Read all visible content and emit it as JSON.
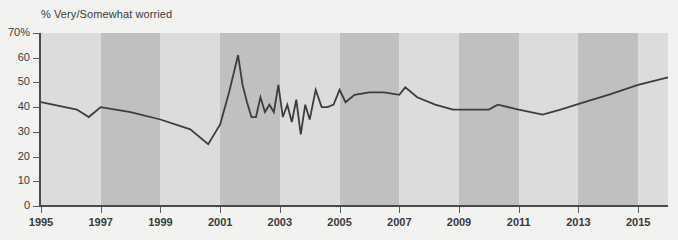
{
  "chart_data": {
    "type": "line",
    "title": "% Very/Somewhat worried",
    "xlabel": "",
    "ylabel": "",
    "ylim": [
      0,
      70
    ],
    "xlim": [
      1995,
      2016
    ],
    "grid": false,
    "legend": "none",
    "y_ticks": [
      "0",
      "10",
      "20",
      "30",
      "40",
      "50",
      "60",
      "70%"
    ],
    "y_tick_values": [
      0,
      10,
      20,
      30,
      40,
      50,
      60,
      70
    ],
    "x_ticks": [
      "1995",
      "1997",
      "1999",
      "2001",
      "2003",
      "2005",
      "2007",
      "2009",
      "2011",
      "2013",
      "2015"
    ],
    "x_tick_values": [
      1995,
      1997,
      1999,
      2001,
      2003,
      2005,
      2007,
      2009,
      2011,
      2013,
      2015
    ],
    "band_shading": "alternating two-year vertical bands, light and dark gray",
    "line_color": "#3d3d3d",
    "band_light_color": "#dcdcdc",
    "band_dark_color": "#c0c0c0",
    "background_color": "#f2f2f0",
    "series": [
      {
        "name": "% Very/Somewhat worried",
        "x": [
          1995.0,
          1996.2,
          1996.6,
          1997.0,
          1998.0,
          1999.0,
          2000.0,
          2000.6,
          2001.0,
          2001.3,
          2001.6,
          2001.75,
          2001.9,
          2002.05,
          2002.2,
          2002.35,
          2002.5,
          2002.65,
          2002.8,
          2002.95,
          2003.1,
          2003.25,
          2003.4,
          2003.55,
          2003.7,
          2003.85,
          2004.0,
          2004.2,
          2004.4,
          2004.6,
          2004.8,
          2005.0,
          2005.2,
          2005.5,
          2006.0,
          2006.5,
          2007.0,
          2007.2,
          2007.6,
          2008.2,
          2008.8,
          2009.3,
          2009.9,
          2010.0,
          2010.3,
          2011.0,
          2011.8,
          2012.4,
          2013.2,
          2014.0,
          2015.0,
          2016.0
        ],
        "values": [
          42,
          39,
          36,
          40,
          38,
          35,
          31,
          25,
          33,
          46,
          61,
          49,
          42,
          36,
          36,
          44,
          38,
          41,
          38,
          49,
          36,
          41,
          34,
          43,
          29,
          41,
          35,
          47,
          40,
          40,
          41,
          47,
          42,
          45,
          46,
          46,
          45,
          48,
          44,
          41,
          39,
          39,
          39,
          39,
          41,
          39,
          37,
          39,
          42,
          45,
          49,
          52
        ]
      }
    ]
  }
}
